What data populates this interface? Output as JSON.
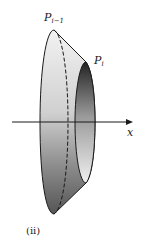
{
  "figure": {
    "caption": "(ii)",
    "labels": {
      "p_prev": {
        "base": "P",
        "sub": "i−1"
      },
      "p_curr": {
        "base": "P",
        "sub": "i"
      },
      "axis": "x"
    },
    "colors": {
      "outline": "#1a1a1a",
      "light_fill": "#d9d9d9",
      "dark_fill": "#555555",
      "background": "#ffffff"
    }
  }
}
